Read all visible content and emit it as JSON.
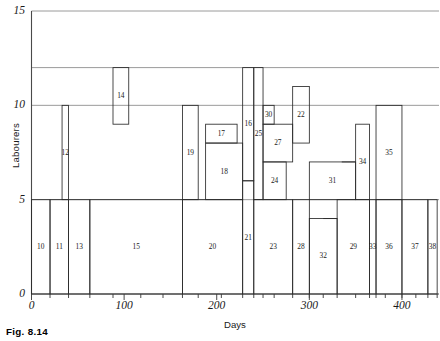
{
  "figure": {
    "caption": "Fig. 8.14"
  },
  "chart_data": {
    "type": "bar",
    "title": "",
    "subtitle": "",
    "xlabel": "Days",
    "ylabel": "Labourers",
    "xlim": [
      0,
      440
    ],
    "ylim": [
      0,
      15
    ],
    "grid": true,
    "grid_axis": "y",
    "legend": "none",
    "x_ticks_labeled": [
      0,
      100,
      200,
      300,
      400
    ],
    "x_tick_labels": [
      "0",
      "100",
      "200",
      "300",
      "400"
    ],
    "y_ticks_labeled": [
      0,
      5,
      10,
      15
    ],
    "y_tick_labels": [
      "0",
      "5",
      "10",
      "15"
    ],
    "gridline_values": [
      5,
      10,
      12,
      15
    ],
    "x_tick_positions": [
      20,
      40,
      63,
      88,
      118,
      142,
      163,
      180,
      205,
      228,
      240,
      250,
      262,
      282,
      300,
      315,
      330,
      350,
      365,
      372,
      382,
      400,
      415,
      428,
      438
    ],
    "blocks": [
      {
        "id": "10",
        "x0": 0,
        "x1": 20,
        "y0": 0,
        "y1": 5
      },
      {
        "id": "11",
        "x0": 20,
        "x1": 40,
        "y0": 0,
        "y1": 5
      },
      {
        "id": "12",
        "x0": 33,
        "x1": 40,
        "y0": 5,
        "y1": 10
      },
      {
        "id": "13",
        "x0": 40,
        "x1": 63,
        "y0": 0,
        "y1": 5
      },
      {
        "id": "14",
        "x0": 88,
        "x1": 105,
        "y0": 9,
        "y1": 12
      },
      {
        "id": "15",
        "x0": 63,
        "x1": 163,
        "y0": 0,
        "y1": 5
      },
      {
        "id": "16",
        "x0": 228,
        "x1": 240,
        "y0": 6,
        "y1": 12
      },
      {
        "id": "17",
        "x0": 188,
        "x1": 222,
        "y0": 8,
        "y1": 9
      },
      {
        "id": "18",
        "x0": 188,
        "x1": 228,
        "y0": 5,
        "y1": 8
      },
      {
        "id": "19",
        "x0": 163,
        "x1": 180,
        "y0": 5,
        "y1": 10
      },
      {
        "id": "20",
        "x0": 163,
        "x1": 228,
        "y0": 0,
        "y1": 5
      },
      {
        "id": "21",
        "x0": 228,
        "x1": 240,
        "y0": 0,
        "y1": 6
      },
      {
        "id": "22",
        "x0": 282,
        "x1": 300,
        "y0": 8,
        "y1": 11
      },
      {
        "id": "23",
        "x0": 240,
        "x1": 282,
        "y0": 0,
        "y1": 5
      },
      {
        "id": "24",
        "x0": 250,
        "x1": 275,
        "y0": 5,
        "y1": 7
      },
      {
        "id": "25",
        "x0": 240,
        "x1": 250,
        "y0": 5,
        "y1": 12
      },
      {
        "id": "27",
        "x0": 250,
        "x1": 282,
        "y0": 7,
        "y1": 9
      },
      {
        "id": "28",
        "x0": 282,
        "x1": 300,
        "y0": 0,
        "y1": 5
      },
      {
        "id": "29",
        "x0": 330,
        "x1": 365,
        "y0": 0,
        "y1": 5
      },
      {
        "id": "30",
        "x0": 250,
        "x1": 262,
        "y0": 9,
        "y1": 10
      },
      {
        "id": "31",
        "x0": 300,
        "x1": 350,
        "y0": 5,
        "y1": 7
      },
      {
        "id": "32",
        "x0": 300,
        "x1": 330,
        "y0": 0,
        "y1": 4
      },
      {
        "id": "33",
        "x0": 365,
        "x1": 372,
        "y0": 0,
        "y1": 5
      },
      {
        "id": "34",
        "x0": 350,
        "x1": 365,
        "y0": 5,
        "y1": 9
      },
      {
        "id": "35",
        "x0": 372,
        "x1": 400,
        "y0": 5,
        "y1": 10
      },
      {
        "id": "36",
        "x0": 372,
        "x1": 400,
        "y0": 0,
        "y1": 5
      },
      {
        "id": "37",
        "x0": 400,
        "x1": 428,
        "y0": 0,
        "y1": 5
      },
      {
        "id": "38",
        "x0": 428,
        "x1": 438,
        "y0": 0,
        "y1": 5
      }
    ],
    "extra_segments": [
      {
        "name": "shelf-31-step",
        "x0": 335,
        "x1": 350,
        "y": 7
      },
      {
        "name": "shelf-32-top",
        "x0": 315,
        "x1": 330,
        "y": 4
      }
    ]
  }
}
